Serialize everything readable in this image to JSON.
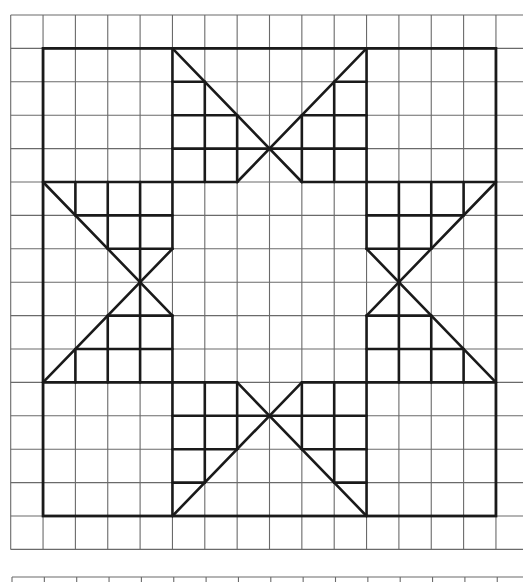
{
  "diagram": {
    "colors": {
      "background": "#ffffff",
      "grid": "#6a6a6a",
      "bold": "#1a1a1a"
    },
    "grid": {
      "origin_x": 10.7,
      "origin_y": 15,
      "cell_w": 32.35,
      "cell_h": 33.4,
      "cols": 16,
      "rows": 16,
      "extend_right_to": 523
    },
    "second_grid": {
      "top_y": 577,
      "origin_x": 12,
      "cols": 16,
      "bottom_y": 582
    },
    "outline_square": {
      "c1": 1,
      "r1": 1,
      "c2": 15,
      "r2": 15
    },
    "pieces": [
      {
        "name": "top-bowtie",
        "segments": [
          [
            5,
            1,
            9,
            5
          ],
          [
            11,
            1,
            7,
            5
          ],
          [
            5,
            1,
            5,
            5
          ],
          [
            6,
            2,
            6,
            5
          ],
          [
            7,
            3,
            7,
            5
          ],
          [
            9,
            3,
            9,
            5
          ],
          [
            10,
            2,
            10,
            5
          ],
          [
            11,
            1,
            11,
            5
          ],
          [
            5,
            2,
            6,
            2
          ],
          [
            10,
            2,
            11,
            2
          ],
          [
            5,
            3,
            7,
            3
          ],
          [
            9,
            3,
            11,
            3
          ],
          [
            5,
            4,
            11,
            4
          ],
          [
            5,
            5,
            7,
            5
          ],
          [
            9,
            5,
            11,
            5
          ]
        ]
      },
      {
        "name": "left-bowtie",
        "segments": [
          [
            1,
            11,
            5,
            7
          ],
          [
            1,
            5,
            5,
            9
          ],
          [
            1,
            11,
            5,
            11
          ],
          [
            2,
            10,
            5,
            10
          ],
          [
            3,
            9,
            5,
            9
          ],
          [
            3,
            7,
            5,
            7
          ],
          [
            2,
            6,
            5,
            6
          ],
          [
            1,
            5,
            5,
            5
          ],
          [
            2,
            11,
            2,
            10
          ],
          [
            2,
            6,
            2,
            5
          ],
          [
            3,
            11,
            3,
            9
          ],
          [
            3,
            7,
            3,
            5
          ],
          [
            4,
            11,
            4,
            5
          ],
          [
            5,
            11,
            5,
            9
          ],
          [
            5,
            7,
            5,
            5
          ]
        ]
      },
      {
        "name": "bottom-bowtie",
        "segments": [
          [
            11,
            15,
            7,
            11
          ],
          [
            5,
            15,
            9,
            11
          ],
          [
            11,
            15,
            11,
            11
          ],
          [
            10,
            14,
            10,
            11
          ],
          [
            9,
            13,
            9,
            11
          ],
          [
            7,
            13,
            7,
            11
          ],
          [
            6,
            14,
            6,
            11
          ],
          [
            5,
            15,
            5,
            11
          ],
          [
            11,
            14,
            10,
            14
          ],
          [
            6,
            14,
            5,
            14
          ],
          [
            11,
            13,
            9,
            13
          ],
          [
            7,
            13,
            5,
            13
          ],
          [
            11,
            12,
            5,
            12
          ],
          [
            11,
            11,
            9,
            11
          ],
          [
            7,
            11,
            5,
            11
          ]
        ]
      },
      {
        "name": "right-bowtie",
        "segments": [
          [
            15,
            5,
            11,
            9
          ],
          [
            15,
            11,
            11,
            7
          ],
          [
            15,
            5,
            11,
            5
          ],
          [
            14,
            6,
            11,
            6
          ],
          [
            13,
            7,
            11,
            7
          ],
          [
            13,
            9,
            11,
            9
          ],
          [
            14,
            10,
            11,
            10
          ],
          [
            15,
            11,
            11,
            11
          ],
          [
            14,
            5,
            14,
            6
          ],
          [
            14,
            10,
            14,
            11
          ],
          [
            13,
            5,
            13,
            7
          ],
          [
            13,
            9,
            13,
            11
          ],
          [
            12,
            5,
            12,
            11
          ],
          [
            11,
            5,
            11,
            7
          ],
          [
            11,
            9,
            11,
            11
          ]
        ]
      }
    ]
  }
}
